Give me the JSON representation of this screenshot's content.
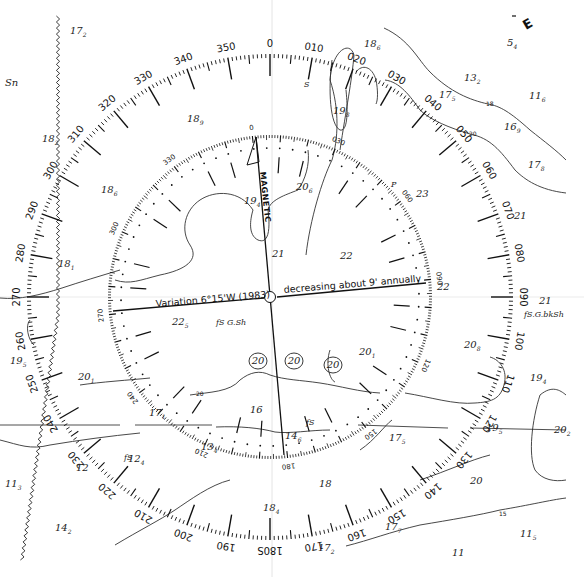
{
  "chart": {
    "type": "nautical-chart-compass-rose",
    "center": {
      "x": 270,
      "y": 297
    },
    "outer_ring": {
      "radius": 243,
      "label_step": 10,
      "labels": [
        "0",
        "010",
        "020",
        "030",
        "040",
        "050",
        "060",
        "070",
        "080",
        "090",
        "100",
        "110",
        "120",
        "130",
        "140",
        "150",
        "160",
        "170",
        "180",
        "190",
        "200",
        "210",
        "220",
        "230",
        "240",
        "250",
        "260",
        "270",
        "280",
        "290",
        "300",
        "310",
        "320",
        "330",
        "340",
        "350"
      ]
    },
    "inner_ring": {
      "radius": 162,
      "rotation_deg": -6.25,
      "visible_labels": [
        {
          "deg": 0,
          "text": "0"
        },
        {
          "deg": 30,
          "text": "030"
        },
        {
          "deg": 60,
          "text": "060"
        },
        {
          "deg": 90,
          "text": "090"
        },
        {
          "deg": 120,
          "text": "120"
        },
        {
          "deg": 150,
          "text": "150"
        },
        {
          "deg": 180,
          "text": "180"
        },
        {
          "deg": 210,
          "text": "210"
        },
        {
          "deg": 240,
          "text": "240"
        },
        {
          "deg": 270,
          "text": "270"
        },
        {
          "deg": 300,
          "text": "300"
        },
        {
          "deg": 330,
          "text": "330"
        }
      ],
      "label": "MAGNETIC"
    },
    "variation": {
      "left": "Variation 6°15'W (1983)",
      "right": "decreasing about 9' annually"
    },
    "corner_letter": "E",
    "outer_180_suffix": "S",
    "ink_color": "#111111",
    "paper_color": "#ffffff"
  },
  "soundings": [
    {
      "x": 70,
      "y": 34,
      "main": "17",
      "sub": "2"
    },
    {
      "x": 5,
      "y": 86,
      "main": "Sn",
      "sub": ""
    },
    {
      "x": 42,
      "y": 142,
      "main": "18",
      "sub": "2"
    },
    {
      "x": 187,
      "y": 122,
      "main": "18",
      "sub": "9"
    },
    {
      "x": 101,
      "y": 193,
      "main": "18",
      "sub": "6"
    },
    {
      "x": 58,
      "y": 267,
      "main": "18",
      "sub": "1"
    },
    {
      "x": 10,
      "y": 364,
      "main": "19",
      "sub": "5"
    },
    {
      "x": 78,
      "y": 380,
      "main": "20",
      "sub": "1"
    },
    {
      "x": 364,
      "y": 47,
      "main": "18",
      "sub": "6"
    },
    {
      "x": 333,
      "y": 114,
      "main": "19",
      "sub": "8"
    },
    {
      "x": 507,
      "y": 46,
      "main": "5",
      "sub": "4"
    },
    {
      "x": 464,
      "y": 81,
      "main": "13",
      "sub": "2"
    },
    {
      "x": 439,
      "y": 98,
      "main": "17",
      "sub": "5"
    },
    {
      "x": 529,
      "y": 99,
      "main": "11",
      "sub": "6"
    },
    {
      "x": 504,
      "y": 130,
      "main": "16",
      "sub": "9"
    },
    {
      "x": 528,
      "y": 168,
      "main": "17",
      "sub": "8"
    },
    {
      "x": 296,
      "y": 190,
      "main": "20",
      "sub": "6"
    },
    {
      "x": 244,
      "y": 204,
      "main": "19",
      "sub": "4"
    },
    {
      "x": 416,
      "y": 197,
      "main": "23",
      "sub": ""
    },
    {
      "x": 514,
      "y": 219,
      "main": "21",
      "sub": ""
    },
    {
      "x": 272,
      "y": 257,
      "main": "21",
      "sub": ""
    },
    {
      "x": 340,
      "y": 259,
      "main": "22",
      "sub": ""
    },
    {
      "x": 437,
      "y": 290,
      "main": "22",
      "sub": ""
    },
    {
      "x": 539,
      "y": 304,
      "main": "21",
      "sub": ""
    },
    {
      "x": 172,
      "y": 325,
      "main": "22",
      "sub": "5"
    },
    {
      "x": 359,
      "y": 355,
      "main": "20",
      "sub": "1"
    },
    {
      "x": 464,
      "y": 348,
      "main": "20",
      "sub": "8"
    },
    {
      "x": 530,
      "y": 381,
      "main": "19",
      "sub": "4"
    },
    {
      "x": 149,
      "y": 416,
      "main": "17",
      "sub": "1"
    },
    {
      "x": 250,
      "y": 413,
      "main": "16",
      "sub": ""
    },
    {
      "x": 285,
      "y": 439,
      "main": "14",
      "sub": "6"
    },
    {
      "x": 201,
      "y": 450,
      "main": "13",
      "sub": "4"
    },
    {
      "x": 389,
      "y": 441,
      "main": "17",
      "sub": "5"
    },
    {
      "x": 486,
      "y": 431,
      "main": "19",
      "sub": "5"
    },
    {
      "x": 554,
      "y": 433,
      "main": "20",
      "sub": "2"
    },
    {
      "x": 128,
      "y": 462,
      "main": "12",
      "sub": "4"
    },
    {
      "x": 76,
      "y": 471,
      "main": "12",
      "sub": ""
    },
    {
      "x": 5,
      "y": 487,
      "main": "11",
      "sub": "3"
    },
    {
      "x": 319,
      "y": 487,
      "main": "18",
      "sub": ""
    },
    {
      "x": 470,
      "y": 484,
      "main": "20",
      "sub": ""
    },
    {
      "x": 263,
      "y": 511,
      "main": "18",
      "sub": "4"
    },
    {
      "x": 55,
      "y": 531,
      "main": "14",
      "sub": "2"
    },
    {
      "x": 385,
      "y": 530,
      "main": "17",
      "sub": "7"
    },
    {
      "x": 318,
      "y": 551,
      "main": "17",
      "sub": "2"
    },
    {
      "x": 520,
      "y": 537,
      "main": "11",
      "sub": "5"
    },
    {
      "x": 452,
      "y": 556,
      "main": "11",
      "sub": ""
    }
  ],
  "circled_depths": [
    {
      "x": 258,
      "y": 364,
      "text": "20"
    },
    {
      "x": 294,
      "y": 364,
      "text": "20"
    },
    {
      "x": 333,
      "y": 368,
      "text": "20"
    }
  ],
  "bottom_notes": [
    {
      "x": 216,
      "y": 325,
      "text": "fS G.Sh"
    },
    {
      "x": 524,
      "y": 317,
      "text": "fS.G.bkSh"
    },
    {
      "x": 124,
      "y": 460,
      "text": "fS"
    },
    {
      "x": 306,
      "y": 425,
      "text": "fS"
    },
    {
      "x": 304,
      "y": 87,
      "text": "S"
    },
    {
      "x": 391,
      "y": 187,
      "text": "P"
    }
  ],
  "contour_labels": [
    {
      "x": 486,
      "y": 106,
      "text": "18"
    },
    {
      "x": 469,
      "y": 136,
      "text": "20"
    },
    {
      "x": 196,
      "y": 396,
      "text": "20"
    },
    {
      "x": 499,
      "y": 516,
      "text": "15"
    },
    {
      "x": 495,
      "y": 516,
      "text": ""
    }
  ]
}
